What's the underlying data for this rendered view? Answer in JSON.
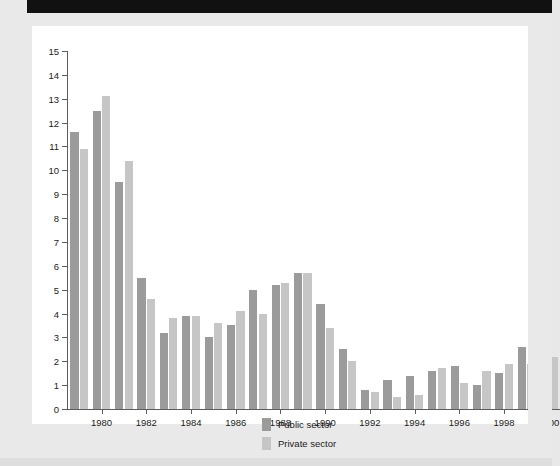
{
  "chart_data": {
    "type": "bar",
    "title": "",
    "subtitle": "",
    "xlabel": "",
    "ylabel": "",
    "grid": false,
    "legend_position": "bottom-center",
    "ylim": [
      0,
      15
    ],
    "ytick_step": 1,
    "yticks": [
      0,
      1,
      2,
      3,
      4,
      5,
      6,
      7,
      8,
      9,
      10,
      11,
      12,
      13,
      14,
      15
    ],
    "ytick_labels": [
      "0",
      "1",
      "2",
      "3",
      "4",
      "5",
      "6",
      "7",
      "8",
      "9",
      "10",
      "11",
      "12",
      "13",
      "14",
      "15"
    ],
    "categories": [
      "1979",
      "1980",
      "1981",
      "1982",
      "1983",
      "1984",
      "1985",
      "1986",
      "1987",
      "1988",
      "1989",
      "1990",
      "1991",
      "1992",
      "1993",
      "1994",
      "1995",
      "1996",
      "1997",
      "1998",
      "1999",
      "2000"
    ],
    "xtick_labels": [
      "1980",
      "1982",
      "1984",
      "1986",
      "1988",
      "1990",
      "1992",
      "1994",
      "1996",
      "1998",
      "2000"
    ],
    "xtick_categories": [
      "1980",
      "1982",
      "1984",
      "1986",
      "1988",
      "1990",
      "1992",
      "1994",
      "1996",
      "1998",
      "2000"
    ],
    "series": [
      {
        "name": "Public sector",
        "color": "#9b9b9b",
        "values": [
          11.6,
          12.5,
          9.5,
          5.5,
          3.2,
          3.9,
          3.0,
          3.5,
          5.0,
          5.2,
          5.7,
          4.4,
          2.5,
          0.8,
          1.2,
          1.4,
          1.6,
          1.8,
          1.0,
          1.5,
          2.6,
          2.5
        ]
      },
      {
        "name": "Private sector",
        "color": "#c6c6c6",
        "values": [
          10.9,
          13.1,
          10.4,
          4.6,
          3.8,
          3.9,
          3.6,
          4.1,
          4.0,
          5.3,
          5.7,
          3.4,
          2.0,
          0.7,
          0.5,
          0.6,
          1.7,
          1.1,
          1.6,
          1.9,
          1.9,
          2.2
        ]
      }
    ]
  },
  "legend": {
    "items": [
      {
        "label": "Public sector",
        "color": "#9b9b9b"
      },
      {
        "label": "Private sector",
        "color": "#c6c6c6"
      }
    ]
  },
  "colors": {
    "public_sector": "#9b9b9b",
    "private_sector": "#c6c6c6",
    "axis": "#5d5d5d",
    "plot_background": "#ffffff",
    "page_background": "#e9e9e9",
    "banner": "#111111",
    "text": "#1b1b1b"
  }
}
